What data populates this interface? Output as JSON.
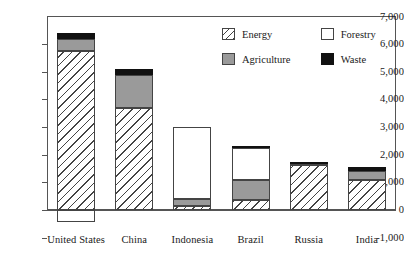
{
  "chart_data": {
    "type": "bar",
    "title": "",
    "xlabel": "",
    "ylabel": "",
    "stacked": true,
    "grid": false,
    "legend_position": "top-right",
    "ylim": [
      -1000,
      7000
    ],
    "ytick_step": 1000,
    "ytick_labels": [
      "7,000",
      "6,000",
      "5,000",
      "4,000",
      "3,000",
      "2,000",
      "1,000",
      "0",
      "-1,000"
    ],
    "ytick_values": [
      7000,
      6000,
      5000,
      4000,
      3000,
      2000,
      1000,
      0,
      -1000
    ],
    "categories": [
      "United States",
      "China",
      "Indonesia",
      "Brazil",
      "Russia",
      "India"
    ],
    "series": [
      {
        "name": "Energy",
        "fill": "diagonal-hatch",
        "values": [
          5750,
          3700,
          150,
          350,
          1620,
          1100
        ]
      },
      {
        "name": "Agriculture",
        "fill": "gray",
        "values": [
          450,
          1200,
          250,
          750,
          60,
          300
        ]
      },
      {
        "name": "Forestry",
        "fill": "white",
        "values": [
          -450,
          0,
          2600,
          1150,
          0,
          0
        ]
      },
      {
        "name": "Waste",
        "fill": "black",
        "values": [
          200,
          200,
          0,
          50,
          70,
          150
        ]
      }
    ],
    "totals_positive": [
      6400,
      5100,
      3000,
      2300,
      1750,
      1550
    ]
  },
  "legend": {
    "entries": [
      {
        "label": "Energy",
        "swatch": "energy"
      },
      {
        "label": "Forestry",
        "swatch": "forestry"
      },
      {
        "label": "Agriculture",
        "swatch": "agriculture"
      },
      {
        "label": "Waste",
        "swatch": "waste"
      }
    ]
  }
}
